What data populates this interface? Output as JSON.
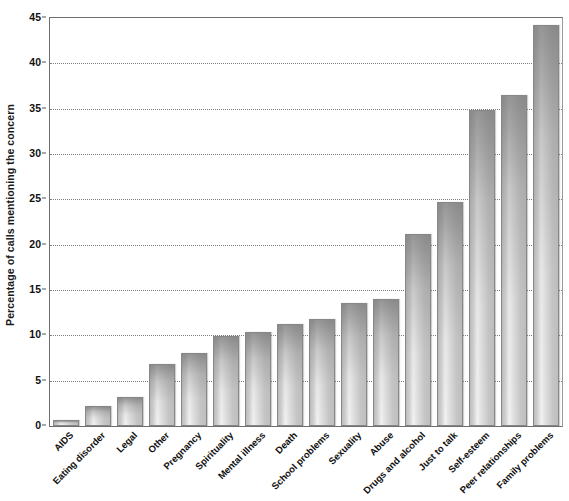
{
  "chart_data": {
    "type": "bar",
    "title": "",
    "subtitle": "",
    "xlabel": "",
    "ylabel": "Percentage of calls mentioning the concern",
    "ylim": [
      0,
      45
    ],
    "ytick_step": 5,
    "yticks": [
      0,
      5,
      10,
      15,
      20,
      25,
      30,
      35,
      40,
      45
    ],
    "ytick_labels": [
      "0",
      "5",
      "10",
      "15",
      "20",
      "25",
      "30",
      "35",
      "40",
      "45"
    ],
    "grid": "horizontal-dotted",
    "legend": "none",
    "orientation": "vertical",
    "xtick_rotation": -45,
    "categories": [
      "AIDS",
      "Eating disorder",
      "Legal",
      "Other",
      "Pregnancy",
      "Spirituality",
      "Mental illness",
      "Death",
      "School problems",
      "Sexuality",
      "Abuse",
      "Drugs and alcohol",
      "Just to talk",
      "Self-esteem",
      "Peer relationships",
      "Family problems"
    ],
    "values": [
      0.7,
      2.2,
      3.2,
      6.8,
      8.0,
      9.9,
      10.4,
      11.2,
      11.8,
      13.6,
      14.0,
      21.2,
      24.7,
      34.9,
      36.5,
      44.2
    ],
    "series": [
      {
        "name": "Percentage of calls mentioning the concern",
        "values": [
          0.7,
          2.2,
          3.2,
          6.8,
          8.0,
          9.9,
          10.4,
          11.2,
          11.8,
          13.6,
          14.0,
          21.2,
          24.7,
          34.9,
          36.5,
          44.2
        ]
      }
    ],
    "colors": {
      "bar_fill_light": "#f2f2f2",
      "bar_fill_mid": "#d2d2d2",
      "bar_fill_dark": "#b9b9b9",
      "bar_border": "#878787",
      "axis": "#6e6e6e",
      "gridline": "#7c7c7c",
      "text": "#111111",
      "background": "#ffffff"
    }
  }
}
